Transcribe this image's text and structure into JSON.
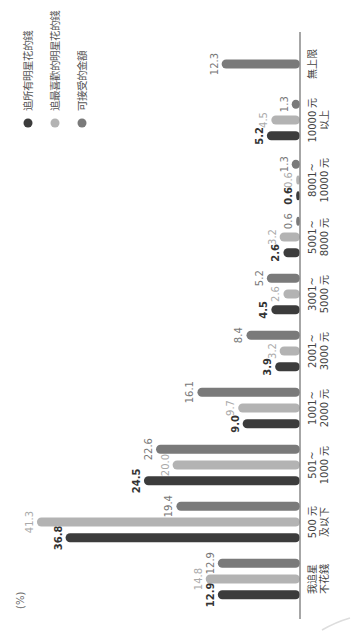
{
  "chart_data": {
    "type": "bar",
    "orientation": "rotated-90-ccw",
    "title": "",
    "ylabel": "(%)",
    "xlabel": "",
    "categories": [
      "我追星\n不花錢",
      "500 元\n及以下",
      "501~\n1000 元",
      "1001~\n2000 元",
      "2001~\n3000 元",
      "3001~\n5000 元",
      "5001~\n8000 元",
      "8001~\n10000 元",
      "10000 元\n以上",
      "無上限"
    ],
    "series": [
      {
        "name": "可接受的金額",
        "color": "#7a7a7a",
        "values": [
          12.9,
          19.4,
          22.6,
          16.1,
          8.4,
          5.2,
          0.6,
          1.3,
          1.3,
          12.3
        ]
      },
      {
        "name": "追最喜歡的明星花的錢",
        "color": "#b3b3b3",
        "values": [
          14.8,
          41.3,
          20.0,
          9.7,
          3.2,
          2.6,
          3.2,
          0.6,
          4.5,
          null
        ]
      },
      {
        "name": "追所有明星花的錢",
        "color": "#3c3c3c",
        "values": [
          12.9,
          36.8,
          24.5,
          9.0,
          3.9,
          4.5,
          2.6,
          0.6,
          5.2,
          null
        ]
      }
    ],
    "value_labels": {
      "可接受的金額": [
        "12.9",
        "19.4",
        "22.6",
        "16.1",
        "8.4",
        "5.2",
        "0.6",
        "1.3",
        "1.3",
        "12.3"
      ],
      "追最喜歡的明星花的錢": [
        "14.8",
        "41.3",
        "20.0",
        "9.7",
        "3.2",
        "2.6",
        "3.2",
        "0.6",
        "4.5",
        ""
      ],
      "追所有明星花的錢": [
        "12.9",
        "36.8",
        "24.5",
        "9.0",
        "3.9",
        "4.5",
        "2.6",
        "0.6",
        "5.2",
        ""
      ]
    },
    "legend": [
      {
        "label": "追所有明星花的錢",
        "color": "#3c3c3c"
      },
      {
        "label": "追最喜歡的明星花的錢",
        "color": "#b3b3b3"
      },
      {
        "label": "可接受的金額",
        "color": "#7a7a7a"
      }
    ],
    "ylim": [
      0,
      45
    ],
    "grid": false,
    "legend_position": "top-right"
  }
}
